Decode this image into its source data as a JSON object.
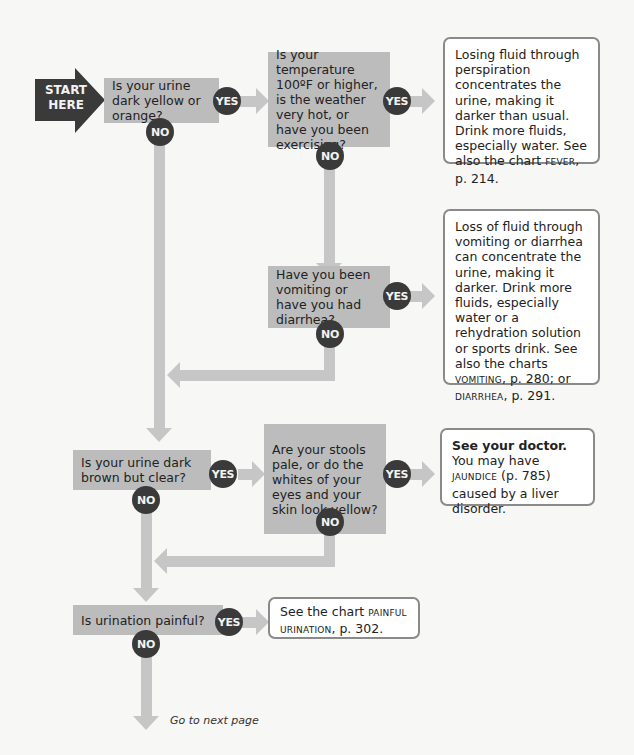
{
  "start": {
    "label_line1": "START",
    "label_line2": "HERE"
  },
  "badges": {
    "yes": "YES",
    "no": "NO"
  },
  "questions": [
    {
      "id": "q1",
      "text": "Is your urine dark yellow or orange?"
    },
    {
      "id": "q2",
      "text": "Is your temperature 100ºF or higher, is the weather very hot, or have you been exercising?"
    },
    {
      "id": "q3",
      "text": "Have you been vomiting or have you had diarrhea?"
    },
    {
      "id": "q4",
      "text": "Is your urine dark brown but clear?"
    },
    {
      "id": "q5",
      "text": "Are your stools pale, or do the whites of your eyes and your skin look yellow?"
    },
    {
      "id": "q6",
      "text": "Is urination painful?"
    }
  ],
  "answers": [
    {
      "id": "a1",
      "text": "Losing fluid through perspiration concentrates the urine, making it darker than usual. Drink more fluids, especially water. See also the chart ",
      "ref1": "FEVER",
      "ref1_page": ", p. 214."
    },
    {
      "id": "a2",
      "text": "Loss of fluid through vomiting or diarrhea can concentrate the urine, making it darker. Drink more fluids, especially water or a rehydration solution or sports drink. See also the charts ",
      "ref1": "VOMITING",
      "ref1_page": ", p. 280; or ",
      "ref2": "DIARRHEA",
      "ref2_page": ", p. 291."
    },
    {
      "id": "a3",
      "bold": "See your doctor.",
      "text": " You may have ",
      "ref1": "JAUNDICE",
      "ref1_page": " (p. 785) caused by a liver disorder."
    },
    {
      "id": "a4",
      "text": "See the chart ",
      "ref1": "PAINFUL URINATION",
      "ref1_page": ", p. 302."
    }
  ],
  "footer": {
    "next_label": "Go to next page"
  }
}
